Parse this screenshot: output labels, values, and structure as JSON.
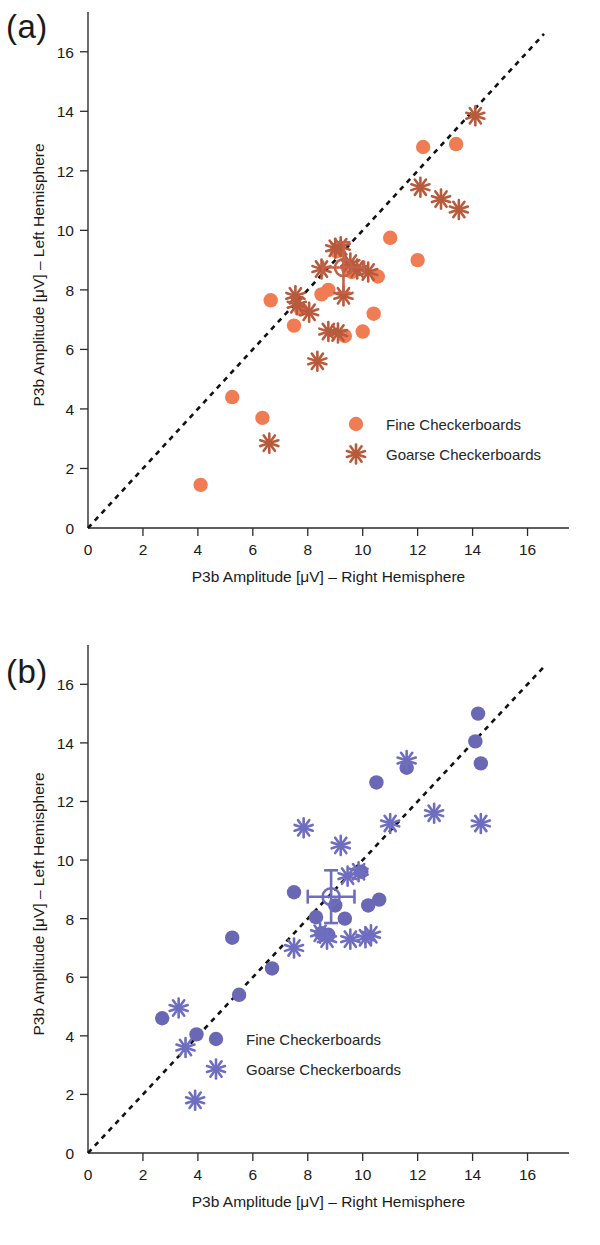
{
  "figure": {
    "panels": [
      {
        "tag": "(a)",
        "condition_color_fine": "#ef7c52",
        "condition_color_coarse": "#b85a3c"
      },
      {
        "tag": "(b)",
        "condition_color_fine": "#6a68b5",
        "condition_color_coarse": "#6f6dc0"
      }
    ]
  },
  "axis": {
    "xlabel": "P3b Amplitude [μV] – Right Hemisphere",
    "ylabel": "P3b Amplitude [μV] – Left Hemisphere",
    "xticks": [
      0,
      2,
      4,
      6,
      8,
      10,
      12,
      14,
      16
    ],
    "yticks": [
      0,
      2,
      4,
      6,
      8,
      10,
      12,
      14,
      16
    ],
    "xlim": [
      0,
      17
    ],
    "ylim": [
      0,
      17
    ]
  },
  "legend": {
    "fine_label": "Fine Checkerboards",
    "coarse_label": "Goarse Checkerboards"
  },
  "chart_data": [
    {
      "type": "scatter",
      "panel": "(a)",
      "title": "",
      "xlabel": "P3b Amplitude [μV] – Right Hemisphere",
      "ylabel": "P3b Amplitude [μV] – Left Hemisphere",
      "xlim": [
        0,
        17
      ],
      "ylim": [
        0,
        17
      ],
      "grid": false,
      "legend_position": "center-right",
      "reference_line": {
        "type": "identity",
        "style": "dotted",
        "from": [
          0,
          0
        ],
        "to": [
          16.6,
          16.6
        ]
      },
      "series": [
        {
          "name": "Fine Checkerboards",
          "marker": "circle",
          "color": "#ef7c52",
          "points": [
            [
              4.1,
              1.45
            ],
            [
              5.25,
              4.4
            ],
            [
              6.35,
              3.7
            ],
            [
              6.65,
              7.65
            ],
            [
              7.5,
              6.8
            ],
            [
              7.75,
              7.35
            ],
            [
              8.5,
              7.85
            ],
            [
              8.75,
              8.0
            ],
            [
              9.05,
              9.3
            ],
            [
              9.35,
              6.45
            ],
            [
              9.45,
              8.75
            ],
            [
              9.6,
              8.6
            ],
            [
              10.0,
              6.6
            ],
            [
              10.4,
              7.2
            ],
            [
              10.55,
              8.45
            ],
            [
              11.0,
              9.75
            ],
            [
              12.0,
              9.0
            ],
            [
              12.2,
              12.8
            ],
            [
              13.4,
              12.9
            ]
          ]
        },
        {
          "name": "Goarse Checkerboards",
          "marker": "asterisk",
          "color": "#b85a3c",
          "points": [
            [
              6.6,
              2.85
            ],
            [
              7.55,
              7.8
            ],
            [
              7.6,
              7.5
            ],
            [
              8.05,
              7.25
            ],
            [
              8.35,
              5.6
            ],
            [
              8.5,
              8.7
            ],
            [
              8.75,
              6.6
            ],
            [
              9.0,
              9.4
            ],
            [
              9.1,
              6.55
            ],
            [
              9.2,
              9.45
            ],
            [
              9.3,
              7.8
            ],
            [
              9.55,
              8.9
            ],
            [
              9.8,
              8.7
            ],
            [
              10.2,
              8.6
            ],
            [
              12.1,
              11.45
            ],
            [
              12.85,
              11.05
            ],
            [
              13.5,
              10.7
            ],
            [
              14.1,
              13.85
            ]
          ]
        }
      ],
      "mean_marker": {
        "x": 9.3,
        "y": 8.75,
        "xerr": 0.75,
        "yerr": 0.85,
        "marker": "circle-cross"
      }
    },
    {
      "type": "scatter",
      "panel": "(b)",
      "title": "",
      "xlabel": "P3b Amplitude [μV] – Right Hemisphere",
      "ylabel": "P3b Amplitude [μV] – Left Hemisphere",
      "xlim": [
        0,
        17
      ],
      "ylim": [
        0,
        17
      ],
      "grid": false,
      "legend_position": "center-right",
      "reference_line": {
        "type": "identity",
        "style": "dotted",
        "from": [
          0,
          0
        ],
        "to": [
          16.6,
          16.6
        ]
      },
      "series": [
        {
          "name": "Fine Checkerboards",
          "marker": "circle",
          "color": "#6a68b5",
          "points": [
            [
              2.7,
              4.6
            ],
            [
              3.95,
              4.05
            ],
            [
              5.25,
              7.35
            ],
            [
              5.5,
              5.4
            ],
            [
              6.7,
              6.3
            ],
            [
              7.5,
              8.9
            ],
            [
              8.3,
              8.05
            ],
            [
              8.5,
              7.5
            ],
            [
              8.75,
              7.45
            ],
            [
              9.0,
              8.45
            ],
            [
              9.35,
              8.0
            ],
            [
              9.95,
              9.6
            ],
            [
              10.2,
              8.45
            ],
            [
              10.5,
              12.65
            ],
            [
              10.6,
              8.65
            ],
            [
              11.6,
              13.15
            ],
            [
              14.1,
              14.05
            ],
            [
              14.2,
              15.0
            ],
            [
              14.3,
              13.3
            ]
          ]
        },
        {
          "name": "Goarse Checkerboards",
          "marker": "asterisk",
          "color": "#6f6dc0",
          "points": [
            [
              3.3,
              4.95
            ],
            [
              3.55,
              3.6
            ],
            [
              3.9,
              1.8
            ],
            [
              7.5,
              7.0
            ],
            [
              7.85,
              11.1
            ],
            [
              8.45,
              7.5
            ],
            [
              8.7,
              7.3
            ],
            [
              9.2,
              10.5
            ],
            [
              9.45,
              9.45
            ],
            [
              9.55,
              7.3
            ],
            [
              9.85,
              9.6
            ],
            [
              10.1,
              7.35
            ],
            [
              10.3,
              7.45
            ],
            [
              11.0,
              11.25
            ],
            [
              11.6,
              13.4
            ],
            [
              12.6,
              11.6
            ],
            [
              14.3,
              11.25
            ]
          ]
        }
      ],
      "mean_marker": {
        "x": 8.85,
        "y": 8.75,
        "xerr": 0.85,
        "yerr": 0.9,
        "marker": "circle-cross"
      }
    }
  ]
}
